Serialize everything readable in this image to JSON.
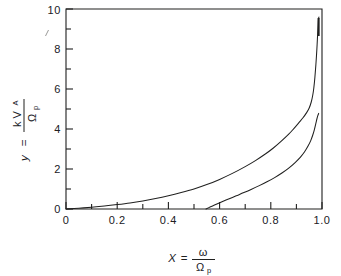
{
  "figure": {
    "kind": "scanned-line-plot",
    "background_color": "#ffffff",
    "ink_color": "#20201f"
  },
  "axes": {
    "x_title_parts": {
      "variable": "X",
      "equals": "=",
      "numerator": "ω",
      "denominator": "Ω",
      "denominator_sub": "p"
    },
    "y_title_parts": {
      "variable": "y",
      "equals": "=",
      "numerator": "k V",
      "numerator_sub": "A",
      "denominator": "Ω",
      "denominator_sub": "p"
    },
    "x_tick_labels": [
      "0",
      "0.2",
      "0.4",
      "0.6",
      "0.8",
      "1.0"
    ],
    "y_tick_labels": [
      "0",
      "2",
      "4",
      "6",
      "8",
      "10"
    ]
  },
  "chart_data": {
    "type": "line",
    "title": "",
    "xlabel": "X = ω / Ωp",
    "ylabel": "y = k VA / Ωp",
    "xlim": [
      0.0,
      1.0
    ],
    "ylim": [
      0.0,
      10.0
    ],
    "xticks": [
      0.0,
      0.2,
      0.4,
      0.6,
      0.8,
      1.0
    ],
    "yticks": [
      0,
      2,
      4,
      6,
      8,
      10
    ],
    "x_minor_ticks": [
      0.1,
      0.3,
      0.5,
      0.7,
      0.9
    ],
    "y_minor_ticks": [
      1,
      3,
      5,
      7,
      9
    ],
    "grid": false,
    "legend": "none",
    "frame": "box",
    "tick_direction": "in",
    "series": [
      {
        "name": "upper branch",
        "x": [
          0.0,
          0.05,
          0.1,
          0.15,
          0.2,
          0.25,
          0.3,
          0.35,
          0.4,
          0.45,
          0.5,
          0.55,
          0.6,
          0.65,
          0.7,
          0.74,
          0.78,
          0.81,
          0.84,
          0.87,
          0.89,
          0.91,
          0.925,
          0.94,
          0.95,
          0.958,
          0.964,
          0.968,
          0.972,
          0.976,
          0.98,
          0.983,
          0.985,
          0.986,
          0.987,
          0.988
        ],
        "y": [
          0.0,
          0.04,
          0.09,
          0.15,
          0.22,
          0.3,
          0.4,
          0.52,
          0.66,
          0.82,
          1.0,
          1.22,
          1.48,
          1.78,
          2.12,
          2.42,
          2.76,
          3.05,
          3.38,
          3.74,
          4.02,
          4.32,
          4.55,
          4.82,
          5.05,
          5.35,
          5.7,
          6.05,
          6.55,
          7.2,
          8.0,
          8.75,
          9.2,
          9.45,
          9.55,
          9.6
        ]
      },
      {
        "name": "lower branch",
        "x": [
          0.547,
          0.56,
          0.58,
          0.605,
          0.635,
          0.665,
          0.695,
          0.725,
          0.755,
          0.785,
          0.815,
          0.845,
          0.87,
          0.895,
          0.915,
          0.932,
          0.946,
          0.956,
          0.964,
          0.97,
          0.976,
          0.98,
          0.984,
          0.987
        ],
        "y": [
          0.0,
          0.08,
          0.2,
          0.34,
          0.5,
          0.66,
          0.82,
          0.99,
          1.17,
          1.36,
          1.57,
          1.81,
          2.04,
          2.32,
          2.58,
          2.86,
          3.16,
          3.42,
          3.7,
          3.96,
          4.28,
          4.5,
          4.68,
          4.78
        ]
      }
    ],
    "annotations": [
      {
        "text": "vertical asymptote near X ≈ 0.99",
        "x": 0.99,
        "y": 10.0
      },
      {
        "text": "lower branch cutoff at X ≈ 0.55",
        "x": 0.547,
        "y": 0.0
      }
    ]
  }
}
